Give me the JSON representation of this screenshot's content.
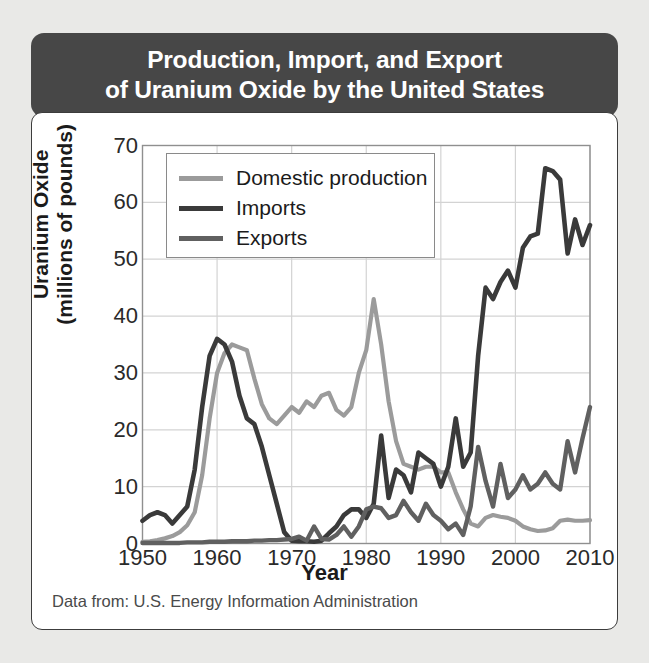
{
  "title": "Production, Import, and Export\nof Uranium Oxide by the United States",
  "source_note": "Data from: U.S. Energy Information Administration",
  "colors": {
    "background": "#e9e9e7",
    "title_banner": "#474747",
    "title_text": "#ffffff",
    "card": "#ffffff",
    "card_border": "#3c3c3c",
    "grid": "#d3d3d3",
    "axis_frame": "#8f8f8f",
    "domestic_production": "#9b9b9b",
    "imports": "#3a3a3a",
    "exports": "#606060"
  },
  "legend": {
    "position": "top-left-inside",
    "entries": [
      {
        "label": "Domestic production",
        "color": "#9b9b9b",
        "swatch": "line-swatch"
      },
      {
        "label": "Imports",
        "color": "#3a3a3a",
        "swatch": "line-swatch"
      },
      {
        "label": "Exports",
        "color": "#606060",
        "swatch": "line-swatch"
      }
    ]
  },
  "chart_data": {
    "type": "line",
    "title": "Production, Import, and Export of Uranium Oxide by the United States",
    "subtitle": "",
    "xlabel": "Year",
    "ylabel": "Uranium Oxide (millions of pounds)",
    "xlim": [
      1950,
      2010
    ],
    "ylim": [
      0,
      70
    ],
    "xticks": [
      1950,
      1960,
      1970,
      1980,
      1990,
      2000,
      2010
    ],
    "yticks": [
      0,
      10,
      20,
      30,
      40,
      50,
      60,
      70
    ],
    "grid": true,
    "legend_position": "upper left",
    "annotations": [
      "Data from: U.S. Energy Information Administration"
    ],
    "x": [
      1950,
      1951,
      1952,
      1953,
      1954,
      1955,
      1956,
      1957,
      1958,
      1959,
      1960,
      1961,
      1962,
      1963,
      1964,
      1965,
      1966,
      1967,
      1968,
      1969,
      1970,
      1971,
      1972,
      1973,
      1974,
      1975,
      1976,
      1977,
      1978,
      1979,
      1980,
      1981,
      1982,
      1983,
      1984,
      1985,
      1986,
      1987,
      1988,
      1989,
      1990,
      1991,
      1992,
      1993,
      1994,
      1995,
      1996,
      1997,
      1998,
      1999,
      2000,
      2001,
      2002,
      2003,
      2004,
      2005,
      2006,
      2007,
      2008,
      2009,
      2010
    ],
    "series": [
      {
        "name": "Domestic production",
        "color": "#9b9b9b",
        "values": [
          0.3,
          0.4,
          0.6,
          0.9,
          1.3,
          2.0,
          3.2,
          5.5,
          12.0,
          22.0,
          30.0,
          33.5,
          35.0,
          34.5,
          34.0,
          29.0,
          24.5,
          22.0,
          21.0,
          22.5,
          24.0,
          23.0,
          25.0,
          24.0,
          26.0,
          26.5,
          23.5,
          22.5,
          24.0,
          30.0,
          34.0,
          43.0,
          35.0,
          25.0,
          18.0,
          14.0,
          13.5,
          13.0,
          13.5,
          13.5,
          12.5,
          12.5,
          9.0,
          6.0,
          3.5,
          3.0,
          4.5,
          5.0,
          4.7,
          4.5,
          4.0,
          3.0,
          2.5,
          2.2,
          2.3,
          2.7,
          4.0,
          4.2,
          4.0,
          4.0,
          4.1
        ]
      },
      {
        "name": "Imports",
        "color": "#3a3a3a",
        "values": [
          4.0,
          5.0,
          5.5,
          5.0,
          3.5,
          5.0,
          6.5,
          13.0,
          24.0,
          33.0,
          36.0,
          35.0,
          32.0,
          26.0,
          22.0,
          21.0,
          17.0,
          12.0,
          7.0,
          2.0,
          0.5,
          0.4,
          0.4,
          0.3,
          0.5,
          1.8,
          3.0,
          5.0,
          6.0,
          6.0,
          4.5,
          7.0,
          19.0,
          8.0,
          13.0,
          12.0,
          9.0,
          16.0,
          15.0,
          14.0,
          10.0,
          13.5,
          22.0,
          13.5,
          16.0,
          33.0,
          45.0,
          43.0,
          46.0,
          48.0,
          45.0,
          52.0,
          54.0,
          54.5,
          66.0,
          65.5,
          64.0,
          51.0,
          57.0,
          52.5,
          56.0
        ]
      },
      {
        "name": "Exports",
        "color": "#606060",
        "values": [
          0.1,
          0.1,
          0.1,
          0.1,
          0.1,
          0.1,
          0.2,
          0.2,
          0.2,
          0.3,
          0.3,
          0.3,
          0.4,
          0.4,
          0.4,
          0.5,
          0.5,
          0.6,
          0.6,
          0.7,
          0.8,
          1.2,
          0.5,
          3.0,
          0.8,
          0.7,
          1.5,
          3.0,
          1.2,
          3.0,
          6.0,
          6.5,
          6.2,
          4.5,
          5.0,
          7.5,
          5.5,
          4.0,
          7.0,
          5.0,
          4.0,
          2.5,
          3.5,
          1.5,
          6.5,
          17.0,
          11.0,
          6.5,
          14.0,
          8.0,
          9.5,
          12.0,
          9.5,
          10.5,
          12.5,
          10.5,
          9.5,
          18.0,
          12.5,
          18.5,
          24.0
        ]
      }
    ]
  },
  "axes": {
    "y_title_line1": "Uranium Oxide",
    "y_title_line2": "(millions of pounds)",
    "x_title": "Year"
  }
}
